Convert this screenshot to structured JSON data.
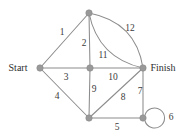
{
  "figure": {
    "type": "graph-diagram",
    "background_color": "#ffffff",
    "node_color": "#999999",
    "edge_color": "#8c8c8c",
    "label_color": "#3b3b3b",
    "width": 184,
    "height": 138
  },
  "terminals": {
    "start_label": "Start",
    "finish_label": "Finish"
  },
  "nodes": [
    {
      "id": "top",
      "name": "node-top",
      "x": 89,
      "y": 13,
      "r": 3.2
    },
    {
      "id": "start",
      "name": "node-start",
      "x": 40,
      "y": 68,
      "r": 3.2
    },
    {
      "id": "center",
      "name": "node-center",
      "x": 90,
      "y": 68,
      "r": 3.2
    },
    {
      "id": "finish",
      "name": "node-finish",
      "x": 143,
      "y": 68,
      "r": 3.2
    },
    {
      "id": "bottom",
      "name": "node-bottom",
      "x": 89,
      "y": 118,
      "r": 3.2
    },
    {
      "id": "bottom_right",
      "name": "node-bottom-right",
      "x": 143,
      "y": 118,
      "r": 3.2
    }
  ],
  "edges": [
    {
      "id": "e1",
      "name": "edge-start-top",
      "weight": "1",
      "from": "start",
      "to": "top",
      "shape": "line",
      "path": "M40,68 L89,13",
      "label_x": 62,
      "label_y": 33
    },
    {
      "id": "e2",
      "name": "edge-top-center",
      "weight": "2",
      "from": "top",
      "to": "center",
      "shape": "line",
      "path": "M89,13 L90,68",
      "label_x": 84,
      "label_y": 44
    },
    {
      "id": "e3",
      "name": "edge-start-center",
      "weight": "3",
      "from": "start",
      "to": "center",
      "shape": "line",
      "path": "M40,68 L90,68",
      "label_x": 66,
      "label_y": 78
    },
    {
      "id": "e4",
      "name": "edge-start-bottom",
      "weight": "4",
      "from": "start",
      "to": "bottom",
      "shape": "line",
      "path": "M40,68 L89,118",
      "label_x": 57,
      "label_y": 97
    },
    {
      "id": "e5",
      "name": "edge-bottom-bottomright",
      "weight": "5",
      "from": "bottom",
      "to": "bottom_right",
      "shape": "line",
      "path": "M89,118 L143,118",
      "label_x": 117,
      "label_y": 128
    },
    {
      "id": "e6",
      "name": "edge-self-loop",
      "weight": "6",
      "from": "bottom_right",
      "to": "bottom_right",
      "shape": "loop",
      "path": "M145,115 A10,10 0 1,1 145,121",
      "label_x": 171,
      "label_y": 118
    },
    {
      "id": "e7",
      "name": "edge-finish-bottomright",
      "weight": "7",
      "from": "finish",
      "to": "bottom_right",
      "shape": "line",
      "path": "M143,68 L143,118",
      "label_x": 140,
      "label_y": 92
    },
    {
      "id": "e8",
      "name": "edge-bottom-finish",
      "weight": "8",
      "from": "bottom",
      "to": "finish",
      "shape": "line",
      "path": "M89,118 L143,68",
      "label_x": 123,
      "label_y": 98
    },
    {
      "id": "e9",
      "name": "edge-center-bottom",
      "weight": "9",
      "from": "center",
      "to": "bottom",
      "shape": "line",
      "path": "M90,68 L89,118",
      "label_x": 94,
      "label_y": 90
    },
    {
      "id": "e10",
      "name": "edge-center-finish",
      "weight": "10",
      "from": "center",
      "to": "finish",
      "shape": "line",
      "path": "M90,68 L143,68",
      "label_x": 113,
      "label_y": 78
    },
    {
      "id": "e11",
      "name": "edge-top-finish-inner",
      "weight": "11",
      "from": "top",
      "to": "finish",
      "shape": "curve",
      "path": "M89,13 Q98,58 143,68",
      "label_x": 103,
      "label_y": 56
    },
    {
      "id": "e12",
      "name": "edge-top-finish-outer",
      "weight": "12",
      "from": "top",
      "to": "finish",
      "shape": "curve",
      "path": "M89,13 Q136,22 143,68",
      "label_x": 130,
      "label_y": 29
    }
  ]
}
